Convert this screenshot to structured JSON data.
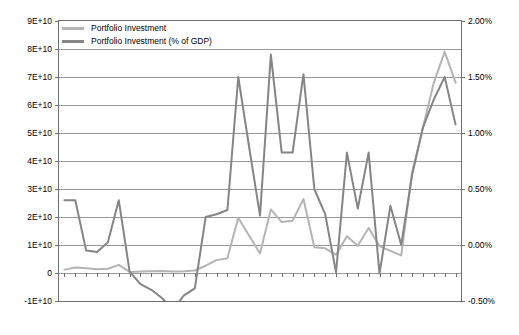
{
  "chart_data": {
    "type": "line",
    "title": "",
    "xlabel": "",
    "ylabel": "",
    "grid": true,
    "legend_position": "top-left",
    "x": [
      1977,
      1978,
      1979,
      1980,
      1981,
      1982,
      1983,
      1984,
      1985,
      1986,
      1987,
      1988,
      1989,
      1990,
      1991,
      1992,
      1993,
      1994,
      1995,
      1996,
      1997,
      1998,
      1999,
      2000,
      2001,
      2002,
      2003,
      2004,
      2005,
      2006,
      2007,
      2008,
      2009,
      2010,
      2011,
      2012,
      2013
    ],
    "categories": [
      "1977",
      "1978",
      "1979",
      "1980",
      "1981",
      "1982",
      "1983",
      "1984",
      "1985",
      "1986",
      "1987",
      "1988",
      "1989",
      "1990",
      "1991",
      "1992",
      "1993",
      "1994",
      "1995",
      "1996",
      "1997",
      "1998",
      "1999",
      "2000",
      "2001",
      "2002",
      "2003",
      "2004",
      "2005",
      "2006",
      "2007",
      "2008",
      "2009",
      "2010",
      "2011",
      "2012",
      "2013"
    ],
    "axes": {
      "left": {
        "label": "",
        "ticks": [
          "9E+10",
          "8E+10",
          "7E+10",
          "6E+10",
          "5E+10",
          "4E+10",
          "3E+10",
          "2E+10",
          "1E+10",
          "0",
          "-1E+10"
        ],
        "values": [
          90000000000,
          80000000000,
          70000000000,
          60000000000,
          50000000000,
          40000000000,
          30000000000,
          20000000000,
          10000000000,
          0,
          -10000000000
        ],
        "min": -10000000000,
        "max": 90000000000
      },
      "right": {
        "label": "",
        "ticks": [
          "2.00%",
          "1.50%",
          "1.00%",
          "0.50%",
          "0.00%",
          "-0.50%"
        ],
        "values": [
          2.0,
          1.5,
          1.0,
          0.5,
          0.0,
          -0.5
        ],
        "min": -0.5,
        "max": 2.0
      }
    },
    "series": [
      {
        "name": "Portfolio Investment",
        "axis": "left",
        "color": "#b4b4b4",
        "values": [
          1200000000,
          2000000000,
          1700000000,
          1300000000,
          1500000000,
          2900000000,
          400000000,
          500000000,
          600000000,
          700000000,
          500000000,
          600000000,
          900000000,
          2600000000,
          4600000000,
          5300000000,
          19700000000,
          13300000000,
          7000000000,
          22700000000,
          18200000000,
          18700000000,
          26400000000,
          9200000000,
          8800000000,
          6500000000,
          13100000000,
          9700000000,
          16100000000,
          9600000000,
          7900000000,
          6300000000,
          36000000000,
          52000000000,
          68000000000,
          79000000000,
          68000000000
        ]
      },
      {
        "name": "Portfolio Investment (% of GDP)",
        "axis": "right",
        "color": "#858585",
        "values_pct": [
          0.49,
          0.49,
          0.12,
          0.11,
          0.19,
          0.49,
          -0.02,
          -0.13,
          -0.18,
          -0.23,
          -0.31,
          -0.21,
          -0.16,
          0.32,
          0.34,
          0.36,
          1.49,
          0.96,
          0.5,
          1.65,
          0.99,
          0.99,
          1.51,
          0.71,
          0.35,
          0.01,
          0.96,
          0.39,
          0.96,
          0.0,
          0.41,
          0.14,
          0.79,
          1.19,
          1.4,
          1.49,
          1.08
        ],
        "values_left_scale": [
          26000000000,
          26000000000,
          8000000000,
          7500000000,
          11000000000,
          26000000000,
          500000000,
          -4000000000,
          -6000000000,
          -9000000000,
          -13000000000,
          -8000000000,
          -5500000000,
          20000000000,
          21000000000,
          22500000000,
          70000000000,
          45000000000,
          20500000000,
          78000000000,
          43000000000,
          43000000000,
          71000000000,
          30000000000,
          21000000000,
          200000000,
          43000000000,
          23000000000,
          43000000000,
          -200000000,
          24000000000,
          10000000000,
          35000000000,
          52000000000,
          62000000000,
          70000000000,
          53000000000
        ]
      }
    ]
  },
  "legend": {
    "items": [
      {
        "label": "Portfolio Investment",
        "color": "#b4b4b4"
      },
      {
        "label": "Portfolio Investment (% of GDP)",
        "color": "#858585"
      }
    ]
  }
}
